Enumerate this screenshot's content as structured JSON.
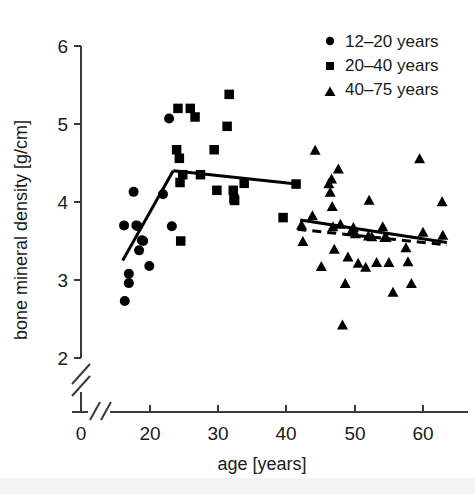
{
  "figure": {
    "background_color": "#ffffff",
    "marker_color": "#000000",
    "axis_color": "#3a3a3a"
  },
  "axes": {
    "x": {
      "title": "age [years]",
      "ticks": [
        0,
        20,
        30,
        40,
        50,
        60
      ],
      "tick_labels": [
        "0",
        "20",
        "30",
        "40",
        "50",
        "60"
      ],
      "broken_axis": true,
      "break_symbol": "//"
    },
    "y": {
      "title": "bone mineral density [g/cm]",
      "ticks": [
        2,
        3,
        4,
        5,
        6
      ],
      "tick_labels": [
        "2",
        "3",
        "4",
        "5",
        "6"
      ],
      "broken_axis": true,
      "break_symbol": "/"
    }
  },
  "legend": {
    "position": "top-right",
    "entries": [
      {
        "label": "12–20 years",
        "marker": "circle-marker"
      },
      {
        "label": "20–40 years",
        "marker": "square-marker"
      },
      {
        "label": "40–75 years",
        "marker": "triangle-marker"
      }
    ]
  },
  "chart_data": {
    "type": "scatter",
    "title": "",
    "xlabel": "age [years]",
    "ylabel": "bone mineral density [g/cm]",
    "xlim": [
      0,
      64
    ],
    "ylim": [
      2,
      6
    ],
    "grid": false,
    "legend_position": "top-right",
    "axis_break_x": [
      0,
      16
    ],
    "axis_break_y": [
      0,
      2
    ],
    "series": [
      {
        "name": "12–20 years",
        "marker": "circle",
        "points": [
          [
            16.2,
            3.7
          ],
          [
            16.3,
            2.73
          ],
          [
            16.9,
            3.08
          ],
          [
            16.9,
            2.96
          ],
          [
            17.6,
            4.13
          ],
          [
            18.0,
            3.7
          ],
          [
            18.2,
            3.69
          ],
          [
            18.4,
            3.38
          ],
          [
            18.8,
            3.51
          ],
          [
            19.0,
            3.5
          ],
          [
            19.9,
            3.18
          ],
          [
            21.9,
            4.1
          ],
          [
            22.8,
            5.07
          ],
          [
            23.2,
            3.69
          ]
        ]
      },
      {
        "name": "20–40 years",
        "marker": "square",
        "points": [
          [
            23.9,
            4.67
          ],
          [
            24.1,
            5.2
          ],
          [
            24.3,
            4.56
          ],
          [
            24.4,
            4.25
          ],
          [
            24.5,
            3.5
          ],
          [
            24.8,
            4.35
          ],
          [
            25.9,
            5.2
          ],
          [
            26.6,
            5.09
          ],
          [
            27.4,
            4.35
          ],
          [
            29.4,
            4.67
          ],
          [
            29.8,
            4.15
          ],
          [
            31.3,
            4.97
          ],
          [
            31.6,
            5.38
          ],
          [
            32.2,
            4.15
          ],
          [
            32.3,
            4.04
          ],
          [
            32.4,
            4.02
          ],
          [
            33.8,
            4.24
          ],
          [
            39.5,
            3.8
          ],
          [
            41.4,
            4.23
          ]
        ]
      },
      {
        "name": "40–75 years",
        "marker": "triangle",
        "points": [
          [
            42.2,
            3.71
          ],
          [
            42.4,
            3.5
          ],
          [
            43.8,
            3.83
          ],
          [
            44.2,
            4.67
          ],
          [
            45.1,
            3.18
          ],
          [
            46.2,
            4.24
          ],
          [
            46.4,
            4.13
          ],
          [
            46.6,
            4.3
          ],
          [
            46.7,
            3.95
          ],
          [
            46.8,
            3.69
          ],
          [
            47.0,
            3.4
          ],
          [
            47.6,
            4.43
          ],
          [
            47.9,
            3.72
          ],
          [
            48.2,
            2.43
          ],
          [
            48.6,
            2.96
          ],
          [
            49.0,
            3.3
          ],
          [
            49.5,
            3.63
          ],
          [
            49.8,
            3.68
          ],
          [
            50.1,
            3.6
          ],
          [
            50.5,
            3.22
          ],
          [
            51.6,
            3.17
          ],
          [
            52.0,
            3.57
          ],
          [
            52.1,
            4.03
          ],
          [
            52.5,
            3.56
          ],
          [
            53.2,
            3.23
          ],
          [
            54.1,
            3.69
          ],
          [
            54.4,
            3.55
          ],
          [
            54.6,
            3.55
          ],
          [
            55.0,
            3.23
          ],
          [
            55.6,
            2.85
          ],
          [
            57.5,
            3.42
          ],
          [
            57.8,
            3.24
          ],
          [
            58.3,
            2.96
          ],
          [
            59.5,
            4.56
          ],
          [
            60.0,
            3.62
          ],
          [
            62.8,
            4.01
          ],
          [
            62.9,
            3.58
          ]
        ]
      }
    ],
    "trend_lines": [
      {
        "name": "growth-phase-line",
        "style": "solid",
        "points": [
          [
            16.0,
            3.25
          ],
          [
            23.4,
            4.4
          ]
        ]
      },
      {
        "name": "plateau-phase-line",
        "style": "solid",
        "points": [
          [
            23.4,
            4.4
          ],
          [
            41.5,
            4.23
          ]
        ]
      },
      {
        "name": "decline-phase-line",
        "style": "solid",
        "points": [
          [
            42.0,
            3.77
          ],
          [
            63.5,
            3.48
          ]
        ]
      },
      {
        "name": "decline-phase-dashed-line",
        "style": "dashed",
        "points": [
          [
            41.6,
            3.65
          ],
          [
            63.5,
            3.45
          ]
        ]
      }
    ]
  }
}
